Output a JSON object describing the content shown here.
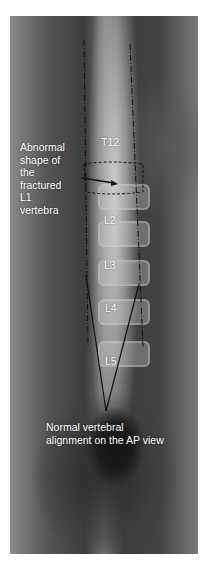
{
  "image": {
    "description": "AP lumbar spine radiograph with annotations",
    "vertebra_labels": [
      "T12",
      "L2",
      "L3",
      "L4",
      "L5"
    ],
    "annotations": {
      "fracture_note": [
        "Abnormal",
        "shape of",
        "the",
        "fractured",
        "L1",
        "vertebra"
      ],
      "alignment_note": [
        "Normal vertebral",
        "alignment on the AP view"
      ]
    }
  }
}
